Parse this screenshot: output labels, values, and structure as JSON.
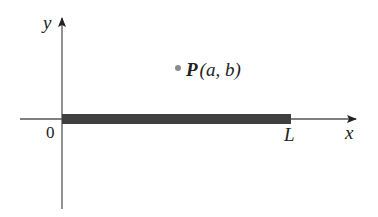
{
  "diagram": {
    "type": "coordinate-plane",
    "axes": {
      "x_label": "x",
      "y_label": "y",
      "origin_label": "0"
    },
    "rod": {
      "start_label": "0",
      "end_label": "L",
      "color": "#3f3f3f"
    },
    "point": {
      "name": "P",
      "coords_label": "(a, b)",
      "full_label": "P(a, b)",
      "color": "#8a8a8a"
    },
    "colors": {
      "axis": "#555555",
      "text": "#222222",
      "background": "#ffffff"
    }
  }
}
